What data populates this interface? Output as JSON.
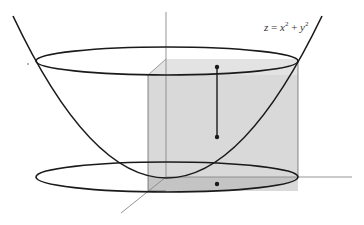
{
  "diagram": {
    "title_label": {
      "lhs": "z",
      "eq": " = ",
      "x": "x",
      "x_exp": "2",
      "plus": " + ",
      "y": "y",
      "y_exp": "2"
    },
    "elements": [
      "paraboloid z = x^2 + y^2 (cross-section curve)",
      "top ellipse (level circle on paraboloid)",
      "bottom ellipse (projection on xy-plane)",
      "shaded cylindrical/box region",
      "vertical segment with two endpoints",
      "point on xy-plane",
      "z-axis, x-axis, y-axis"
    ],
    "colors": {
      "curve": "#1a1a1a",
      "axis": "#888888",
      "box_front": "#d9d9d9",
      "box_top": "#e3e3e3",
      "box_bottom_band": "#bdbdbd",
      "point": "#1a1a1a"
    }
  }
}
